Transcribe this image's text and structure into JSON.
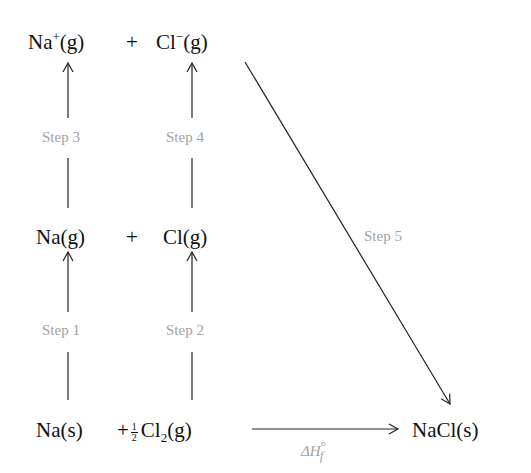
{
  "diagram": {
    "type": "Born-Haber cycle",
    "rows": {
      "top": {
        "left": {
          "base": "Na",
          "charge": "+",
          "state": "(g)"
        },
        "plus": "+",
        "right": {
          "base": "Cl",
          "charge": "−",
          "state": "(g)"
        }
      },
      "middle": {
        "left": {
          "text": "Na(g)"
        },
        "plus": "+",
        "right": {
          "text": "Cl(g)"
        }
      },
      "bottom": {
        "left": {
          "text": "Na(s)"
        },
        "plus": "+",
        "half_num": "1",
        "half_den": "2",
        "right": {
          "base": "Cl",
          "sub": "2",
          "state": "(g)"
        },
        "product": {
          "text": "NaCl(s)"
        }
      }
    },
    "steps": {
      "step1": "Step 1",
      "step2": "Step 2",
      "step3": "Step 3",
      "step4": "Step 4",
      "step5": "Step 5"
    },
    "formation_label": {
      "delta_h": "ΔH",
      "sup": "°",
      "sub": "f"
    },
    "colors": {
      "text": "#111111",
      "label": "#a3a3a3",
      "line": "#222222",
      "background": "#ffffff"
    }
  }
}
